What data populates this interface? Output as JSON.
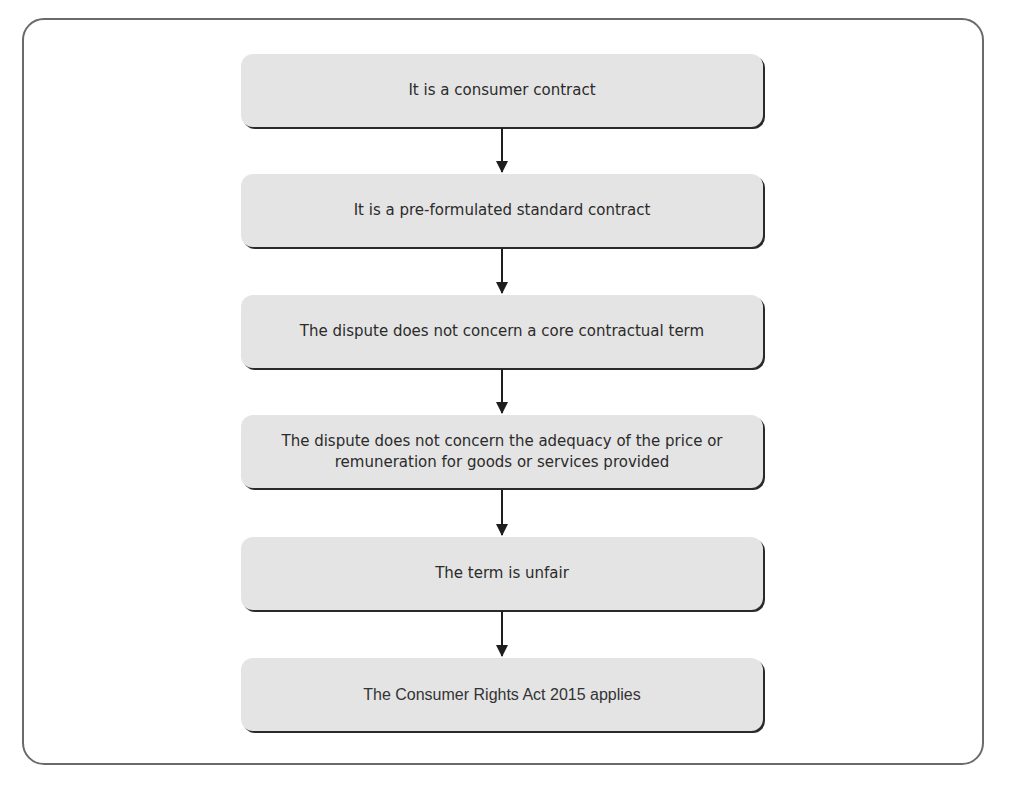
{
  "diagram": {
    "type": "flowchart",
    "direction": "top-to-bottom",
    "steps": [
      {
        "label": "It is a consumer contract"
      },
      {
        "label": "It is a pre-formulated standard contract"
      },
      {
        "label": "The dispute does not concern a core contractual term"
      },
      {
        "label": "The dispute does not concern the adequacy of the price or remuneration for goods or services provided"
      },
      {
        "label": "The term is unfair"
      },
      {
        "label": "The Consumer Rights Act 2015 applies"
      }
    ],
    "connectors": [
      {
        "from": 0,
        "to": 1
      },
      {
        "from": 1,
        "to": 2
      },
      {
        "from": 2,
        "to": 3
      },
      {
        "from": 3,
        "to": 4
      },
      {
        "from": 4,
        "to": 5
      }
    ],
    "colors": {
      "box_fill": "#e4e4e4",
      "box_shadow": "#2a2a2a",
      "text": "#2b2b2b",
      "arrow": "#1e1e1e",
      "frame": "#6a6a6a"
    }
  }
}
